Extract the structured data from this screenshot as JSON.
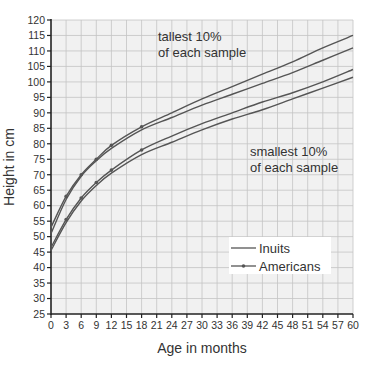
{
  "chart_data": {
    "type": "line",
    "title": "",
    "xlabel": "Age in months",
    "ylabel": "Height in cm",
    "xlim": [
      0,
      60
    ],
    "ylim": [
      25,
      120
    ],
    "grid": true,
    "x_ticks": [
      0,
      3,
      6,
      9,
      12,
      15,
      18,
      21,
      24,
      27,
      30,
      33,
      36,
      39,
      42,
      45,
      48,
      51,
      54,
      57,
      60
    ],
    "y_ticks": [
      25,
      30,
      35,
      40,
      45,
      50,
      55,
      60,
      65,
      70,
      75,
      80,
      85,
      90,
      95,
      100,
      105,
      110,
      115,
      120
    ],
    "x": [
      0,
      3,
      6,
      9,
      12,
      18,
      24,
      30,
      36,
      42,
      48,
      54,
      60
    ],
    "series": [
      {
        "name": "Americans (tallest 10%)",
        "group": "Americans",
        "marker": true,
        "values": [
          53,
          63,
          70,
          75,
          79.5,
          85.5,
          90,
          94.5,
          98.5,
          102.5,
          106.5,
          111,
          115
        ]
      },
      {
        "name": "Inuits (tallest 10%)",
        "group": "Inuits",
        "marker": false,
        "values": [
          51,
          62,
          69.5,
          74.5,
          78.5,
          84.5,
          88.5,
          92.5,
          96,
          99.5,
          103,
          107,
          111
        ]
      },
      {
        "name": "Americans (smallest 10%)",
        "group": "Americans",
        "marker": true,
        "values": [
          46.5,
          55.5,
          62.5,
          67.5,
          71.5,
          78,
          82.5,
          86.5,
          90,
          93.5,
          96.5,
          100,
          104
        ]
      },
      {
        "name": "Inuits (smallest 10%)",
        "group": "Inuits",
        "marker": false,
        "values": [
          45.5,
          54.5,
          61.5,
          66.5,
          70.5,
          76.5,
          80.5,
          84.5,
          88,
          91,
          94.5,
          98,
          101.5
        ]
      }
    ],
    "legend": {
      "position": "lower right",
      "entries": [
        "Inuits",
        "Americans"
      ]
    },
    "annotations": [
      {
        "text": [
          "tallest 10%",
          "of each sample"
        ],
        "x": 15.5,
        "y": 112
      },
      {
        "text": [
          "smallest 10%",
          "of each sample"
        ],
        "x": 36,
        "y": 81
      }
    ]
  },
  "labels": {
    "xlabel": "Age in months",
    "ylabel": "Height in cm",
    "annot_tall_1": "tallest 10%",
    "annot_tall_2": "of each sample",
    "annot_small_1": "smallest 10%",
    "annot_small_2": "of each sample",
    "legend_inuits": "Inuits",
    "legend_americans": "Americans"
  },
  "colors": {
    "plot_bg": "#f1f1f1",
    "grid": "#c4c4c4",
    "axis": "#222222",
    "line": "#555555"
  }
}
